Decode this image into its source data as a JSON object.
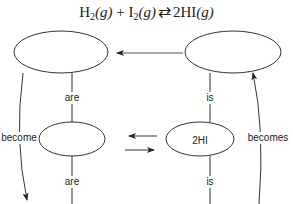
{
  "title": {
    "equation_parts": {
      "h2": "H",
      "h2_sub": "2",
      "g1": "(g)",
      "plus": " + ",
      "i2": "I",
      "i2_sub": "2",
      "g2": "(g)",
      "arrow": "⇄",
      "product": "2HI",
      "g3": "(g)"
    }
  },
  "nodes": {
    "top_left": "",
    "top_right": "",
    "middle_left": "",
    "middle_right": "2HI",
    "bottom_left": "",
    "bottom_right": ""
  },
  "links": {
    "left_top": "are",
    "left_bottom": "are",
    "right_top": "is",
    "right_bottom": "is",
    "left_curve": "become",
    "right_curve": "becomes"
  },
  "colors": {
    "stroke": "#333333",
    "text": "#222222",
    "background": "#ffffff"
  }
}
